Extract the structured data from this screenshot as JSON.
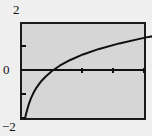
{
  "figure": {
    "name": "logarithm-graph",
    "background_color": "#efefef",
    "plot_background_color": "#d6d6d6",
    "frame_color": "#1a1a1a",
    "curve_color": "#111111"
  },
  "labels": {
    "y_max": "2",
    "y_zero": "0",
    "y_min": "−2"
  },
  "chart_data": {
    "type": "line",
    "title": "",
    "xlabel": "",
    "ylabel": "",
    "xlim": [
      0,
      4
    ],
    "ylim": [
      -2,
      2
    ],
    "ytick_labels": [
      "2",
      "0",
      "−2"
    ],
    "ytick_values": [
      2,
      0,
      -2
    ],
    "ytick_minor_values": [
      1,
      -1
    ],
    "xtick_values": [
      1,
      2,
      3
    ],
    "xtick_labels": [
      "",
      "",
      ""
    ],
    "grid": false,
    "legend": null,
    "series": [
      {
        "name": "y = ln(x)",
        "x": [
          0.13,
          0.16,
          0.2,
          0.25,
          0.32,
          0.4,
          0.5,
          0.63,
          0.79,
          1.0,
          1.26,
          1.59,
          2.0,
          2.52,
          3.17,
          4.0,
          4.6
        ],
        "y": [
          -2.0,
          -1.8,
          -1.61,
          -1.39,
          -1.14,
          -0.92,
          -0.69,
          -0.46,
          -0.24,
          0.0,
          0.23,
          0.46,
          0.69,
          0.92,
          1.15,
          1.39,
          1.53
        ]
      }
    ],
    "annotations": [],
    "x_axis_line_y": 0,
    "zero_crossing_x": 1.0
  }
}
